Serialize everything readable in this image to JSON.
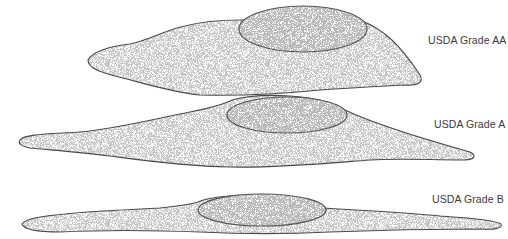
{
  "figure": {
    "type": "illustration",
    "eggs": [
      {
        "id": "grade-aa",
        "label": "USDA Grade AA"
      },
      {
        "id": "grade-a",
        "label": "USDA Grade A"
      },
      {
        "id": "grade-b",
        "label": "USDA Grade B"
      }
    ],
    "colors": {
      "outline": "#4a4a4a",
      "stipple": "#6b6b6b",
      "background": "#ffffff",
      "label": "#3a3a3a"
    }
  }
}
